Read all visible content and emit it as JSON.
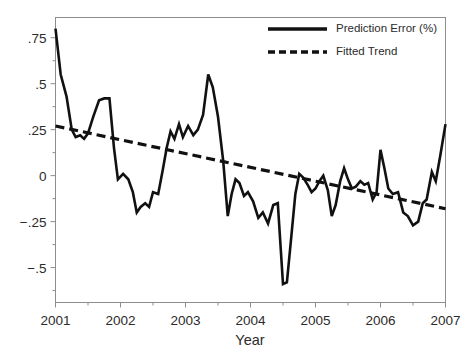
{
  "chart_data": {
    "type": "line",
    "title": "",
    "xlabel": "Year",
    "ylabel": "",
    "xlim": [
      2001,
      2007
    ],
    "ylim": [
      -0.69,
      0.86
    ],
    "grid": false,
    "legend_position": "top-right",
    "xticks": [
      "2001",
      "2002",
      "2003",
      "2004",
      "2005",
      "2006",
      "2007"
    ],
    "xtick_values": [
      2001,
      2002,
      2003,
      2004,
      2005,
      2006,
      2007
    ],
    "yticks": [
      ".75",
      ".5",
      ".25",
      "0",
      "−.25",
      "−.5"
    ],
    "ytick_values": [
      0.75,
      0.5,
      0.25,
      0,
      -0.25,
      -0.5
    ],
    "legend": [
      {
        "label": "Prediction Error (%)",
        "style": "solid"
      },
      {
        "label": "Fitted Trend",
        "style": "dashed"
      }
    ],
    "series": [
      {
        "name": "Prediction Error (%)",
        "style": "solid",
        "x": [
          2001.0,
          2001.08,
          2001.17,
          2001.25,
          2001.31,
          2001.38,
          2001.44,
          2001.5,
          2001.58,
          2001.67,
          2001.75,
          2001.83,
          2001.9,
          2001.96,
          2002.04,
          2002.12,
          2002.19,
          2002.25,
          2002.31,
          2002.38,
          2002.44,
          2002.5,
          2002.58,
          2002.65,
          2002.71,
          2002.77,
          2002.83,
          2002.9,
          2002.96,
          2003.04,
          2003.12,
          2003.19,
          2003.27,
          2003.35,
          2003.42,
          2003.5,
          2003.58,
          2003.65,
          2003.71,
          2003.77,
          2003.83,
          2003.9,
          2003.96,
          2004.04,
          2004.12,
          2004.19,
          2004.27,
          2004.35,
          2004.42,
          2004.5,
          2004.56,
          2004.62,
          2004.69,
          2004.75,
          2004.81,
          2004.88,
          2004.94,
          2005.0,
          2005.06,
          2005.12,
          2005.19,
          2005.25,
          2005.31,
          2005.38,
          2005.44,
          2005.5,
          2005.56,
          2005.62,
          2005.69,
          2005.75,
          2005.81,
          2005.88,
          2005.94,
          2006.0,
          2006.06,
          2006.12,
          2006.19,
          2006.27,
          2006.35,
          2006.42,
          2006.5,
          2006.58,
          2006.65,
          2006.71,
          2006.79,
          2006.85,
          2006.92,
          2007.0
        ],
        "y": [
          0.8,
          0.55,
          0.43,
          0.25,
          0.21,
          0.22,
          0.2,
          0.23,
          0.32,
          0.41,
          0.42,
          0.42,
          0.15,
          -0.02,
          0.01,
          -0.02,
          -0.09,
          -0.2,
          -0.17,
          -0.15,
          -0.17,
          -0.09,
          -0.1,
          0.03,
          0.15,
          0.24,
          0.2,
          0.28,
          0.21,
          0.27,
          0.22,
          0.25,
          0.33,
          0.55,
          0.48,
          0.32,
          0.08,
          -0.22,
          -0.1,
          -0.02,
          -0.04,
          -0.11,
          -0.09,
          -0.14,
          -0.23,
          -0.2,
          -0.26,
          -0.16,
          -0.15,
          -0.59,
          -0.58,
          -0.36,
          -0.1,
          0.01,
          -0.01,
          -0.05,
          -0.09,
          -0.07,
          -0.03,
          0.0,
          -0.08,
          -0.22,
          -0.16,
          -0.03,
          0.04,
          -0.02,
          -0.07,
          -0.06,
          -0.03,
          -0.05,
          -0.04,
          -0.13,
          -0.09,
          0.14,
          0.04,
          -0.07,
          -0.1,
          -0.09,
          -0.2,
          -0.22,
          -0.27,
          -0.25,
          -0.15,
          -0.13,
          0.02,
          -0.03,
          0.11,
          0.28
        ]
      },
      {
        "name": "Fitted Trend",
        "style": "dashed",
        "x": [
          2001.0,
          2007.0
        ],
        "y": [
          0.27,
          -0.18
        ]
      }
    ]
  }
}
